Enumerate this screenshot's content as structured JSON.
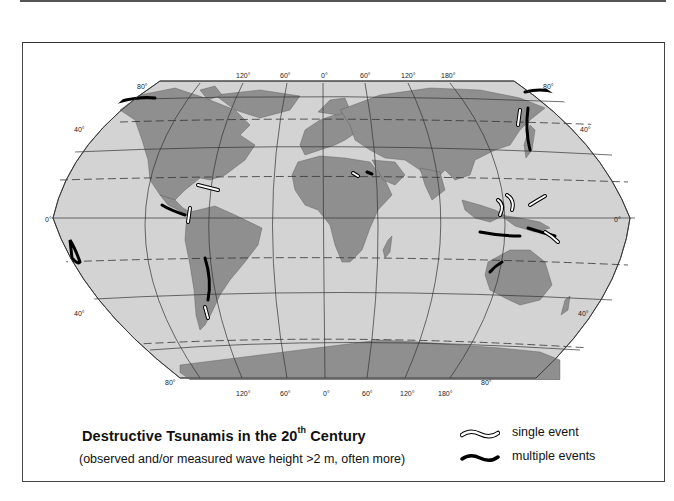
{
  "map": {
    "title_main": "Destructive Tsunamis in the 20",
    "title_sup": "th",
    "title_end": " Century",
    "subtitle": "(observed and/or measured wave height >2 m, often more)",
    "projection": "Winkel-style world map",
    "colors": {
      "ocean": "#d3d3d3",
      "land": "#8f8f8f",
      "graticule": "#333333",
      "single_event": "#ffffff",
      "multiple_events": "#000000"
    },
    "longitude_labels_top": [
      "120°",
      "60°",
      "0°",
      "60°",
      "120°",
      "180°"
    ],
    "longitude_labels_bottom": [
      "120°",
      "60°",
      "0°",
      "60°",
      "120°",
      "180°"
    ],
    "latitude_labels_left": [
      "80°",
      "40°",
      "0°",
      "40°",
      "80°"
    ],
    "latitude_labels_right": [
      "80°",
      "40°",
      "0°",
      "40°",
      "80°"
    ]
  },
  "legend": {
    "items": [
      {
        "icon": "single-event-wave-icon",
        "label": "single event"
      },
      {
        "icon": "multiple-events-wave-icon",
        "label": "multiple events"
      }
    ]
  }
}
